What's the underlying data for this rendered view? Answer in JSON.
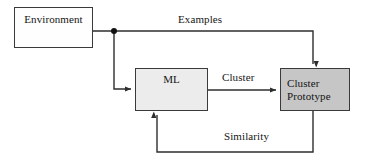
{
  "diagram": {
    "background_color": "#ffffff",
    "stroke_color": "#3a3a3a",
    "nodes": [
      {
        "id": "environment",
        "label": "Environment",
        "fill": "#fefefe",
        "x": 14,
        "y": 7,
        "w": 79,
        "h": 41
      },
      {
        "id": "ml",
        "label": "ML",
        "fill": "#ececec",
        "x": 135,
        "y": 68,
        "w": 73,
        "h": 43
      },
      {
        "id": "cluster_prototype",
        "label": "Cluster\nPrototype",
        "fill": "#c6c6c6",
        "x": 280,
        "y": 68,
        "w": 70,
        "h": 43
      }
    ],
    "edges": [
      {
        "id": "examples",
        "label": "Examples",
        "from": "environment",
        "to": "cluster_prototype",
        "label_x": 178,
        "label_y": 13
      },
      {
        "id": "environment_to_ml",
        "label": "",
        "from": "environment",
        "to": "ml"
      },
      {
        "id": "cluster",
        "label": "Cluster",
        "from": "ml",
        "to": "cluster_prototype",
        "label_x": 222,
        "label_y": 71
      },
      {
        "id": "similarity",
        "label": "Similarity",
        "from": "cluster_prototype",
        "to": "ml",
        "label_x": 224,
        "label_y": 130
      }
    ],
    "junction": {
      "x": 114,
      "y": 31,
      "radius": 3
    }
  }
}
